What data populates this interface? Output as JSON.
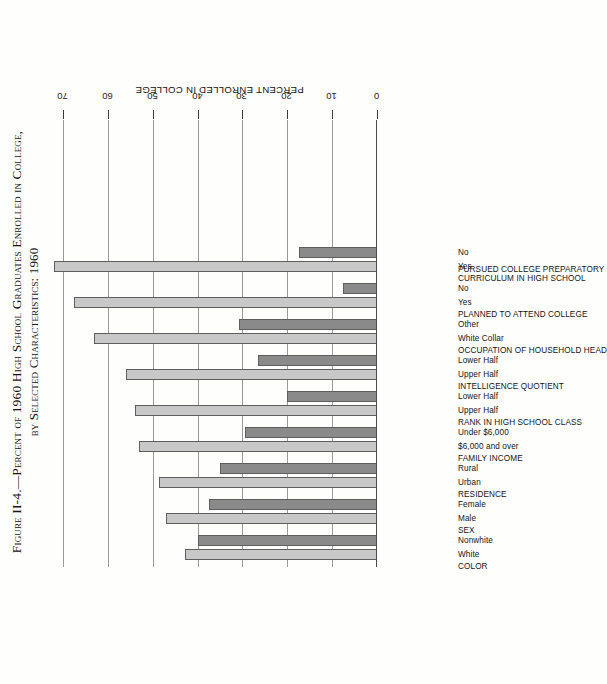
{
  "figure": {
    "number": "Figure II-4.",
    "dash": "—",
    "title_main": "Percent of 1960 High School Graduates Enrolled in College,",
    "title_sub": "by Selected Characteristics: 1960",
    "full_title": "Figure II-4.—Percent of 1960 High School Graduates Enrolled in College, by Selected Characteristics: 1960"
  },
  "axis": {
    "title": "PERCENT ENROLLED IN COLLEGE",
    "ticks": [
      "0",
      "10",
      "20",
      "30",
      "40",
      "50",
      "60",
      "70"
    ],
    "min": 0,
    "max": 70,
    "step": 10
  },
  "colors": {
    "bar_light": "#c8c8c8",
    "bar_dark": "#8a8a8a",
    "bar_outline": "#5e5e5e",
    "gridline": "#9a9a9a",
    "axis": "#3a3a3a",
    "text": "#141414",
    "background": "#fefefd"
  },
  "chart_data": {
    "type": "bar",
    "title": "Figure II-4.—Percent of 1960 High School Graduates Enrolled in College, by Selected Characteristics: 1960",
    "orientation": "vertical-bars-rotated-90",
    "xlabel": "",
    "ylabel": "PERCENT ENROLLED IN COLLEGE",
    "ylim": [
      0,
      70
    ],
    "ytick_step": 10,
    "grid": true,
    "legend": false,
    "groups": [
      {
        "header": "COLOR",
        "bars": [
          {
            "label": "White",
            "value": 42.7,
            "shade": "light"
          },
          {
            "label": "Nonwhite",
            "value": 40.0,
            "shade": "dark"
          }
        ]
      },
      {
        "header": "SEX",
        "bars": [
          {
            "label": "Male",
            "value": 47.0,
            "shade": "light"
          },
          {
            "label": "Female",
            "value": 37.5,
            "shade": "dark"
          }
        ]
      },
      {
        "header": "RESIDENCE",
        "bars": [
          {
            "label": "Urban",
            "value": 48.5,
            "shade": "light"
          },
          {
            "label": "Rural",
            "value": 35.0,
            "shade": "dark"
          }
        ]
      },
      {
        "header": "FAMILY INCOME",
        "bars": [
          {
            "label": "$6,000 and over",
            "value": 53.0,
            "shade": "light"
          },
          {
            "label": "Under $6,000",
            "value": 29.5,
            "shade": "dark"
          }
        ]
      },
      {
        "header": "RANK IN HIGH SCHOOL CLASS",
        "bars": [
          {
            "label": "Upper Half",
            "value": 54.0,
            "shade": "light"
          },
          {
            "label": "Lower Half",
            "value": 20.0,
            "shade": "dark"
          }
        ]
      },
      {
        "header": "INTELLIGENCE QUOTIENT",
        "bars": [
          {
            "label": "Upper Half",
            "value": 56.0,
            "shade": "light"
          },
          {
            "label": "Lower Half",
            "value": 26.5,
            "shade": "dark"
          }
        ]
      },
      {
        "header": "OCCUPATION OF HOUSEHOLD HEAD",
        "bars": [
          {
            "label": "White Collar",
            "value": 63.0,
            "shade": "light"
          },
          {
            "label": "Other",
            "value": 30.7,
            "shade": "dark"
          }
        ]
      },
      {
        "header": "PLANNED TO ATTEND COLLEGE",
        "bars": [
          {
            "label": "Yes",
            "value": 67.6,
            "shade": "light"
          },
          {
            "label": "No",
            "value": 7.5,
            "shade": "dark"
          }
        ]
      },
      {
        "header": "PURSUED COLLEGE PREPARATORY CURRICULUM IN HIGH SCHOOL",
        "header_lines": [
          "PURSUED COLLEGE PREPARATORY",
          "CURRICULUM IN HIGH SCHOOL"
        ],
        "bars": [
          {
            "label": "Yes",
            "value": 72.0,
            "shade": "light"
          },
          {
            "label": "No",
            "value": 17.5,
            "shade": "dark"
          }
        ]
      }
    ]
  }
}
